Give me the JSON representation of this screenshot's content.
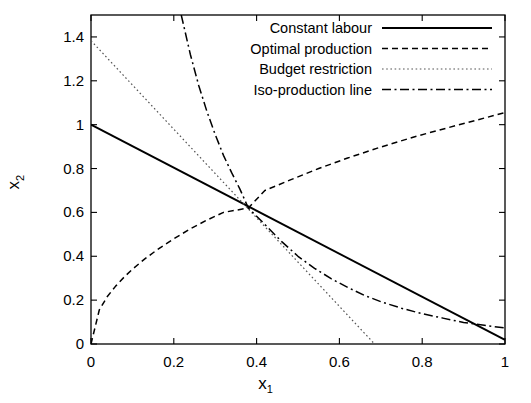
{
  "chart_data": {
    "type": "line",
    "title": "",
    "xlabel": "x_1",
    "ylabel": "x_2",
    "xlabel_base": "x",
    "xlabel_sub": "1",
    "ylabel_base": "x",
    "ylabel_sub": "2",
    "xlim": [
      0,
      1
    ],
    "ylim": [
      0,
      1.5
    ],
    "xticks": [
      "0",
      "0.2",
      "0.4",
      "0.6",
      "0.8",
      "1"
    ],
    "xtick_values": [
      0,
      0.2,
      0.4,
      0.6,
      0.8,
      1
    ],
    "yticks": [
      "0",
      "0.2",
      "0.4",
      "0.6",
      "0.8",
      "1",
      "1.2",
      "1.4"
    ],
    "ytick_values": [
      0,
      0.2,
      0.4,
      0.6,
      0.8,
      1.0,
      1.2,
      1.4
    ],
    "grid": false,
    "legend_position": "top-right",
    "intersection_point": [
      0.38,
      0.62
    ],
    "series": [
      {
        "name": "Constant labour",
        "style": "solid",
        "color": "#000000",
        "width": 1.9,
        "points": [
          [
            0,
            1.0
          ],
          [
            1.0,
            0.019
          ]
        ]
      },
      {
        "name": "Optimal production",
        "style": "dashed",
        "color": "#000000",
        "width": 1.5,
        "points": [
          [
            0,
            0
          ],
          [
            0.02,
            0.155
          ],
          [
            0.04,
            0.218
          ],
          [
            0.06,
            0.265
          ],
          [
            0.08,
            0.305
          ],
          [
            0.1,
            0.341
          ],
          [
            0.13,
            0.388
          ],
          [
            0.16,
            0.43
          ],
          [
            0.2,
            0.48
          ],
          [
            0.24,
            0.525
          ],
          [
            0.28,
            0.565
          ],
          [
            0.32,
            0.6
          ],
          [
            0.38,
            0.62
          ],
          [
            0.42,
            0.7
          ],
          [
            0.48,
            0.747
          ],
          [
            0.55,
            0.8
          ],
          [
            0.62,
            0.848
          ],
          [
            0.7,
            0.898
          ],
          [
            0.78,
            0.944
          ],
          [
            0.86,
            0.985
          ],
          [
            0.93,
            1.02
          ],
          [
            1.0,
            1.055
          ]
        ]
      },
      {
        "name": "Budget restriction",
        "style": "dotted",
        "color": "#555555",
        "width": 1.2,
        "points": [
          [
            0,
            1.383
          ],
          [
            0.685,
            0
          ]
        ]
      },
      {
        "name": "Iso-production line",
        "style": "dashdot",
        "color": "#000000",
        "width": 1.5,
        "points": [
          [
            0.218,
            1.5
          ],
          [
            0.24,
            1.32
          ],
          [
            0.26,
            1.18
          ],
          [
            0.28,
            1.06
          ],
          [
            0.3,
            0.955
          ],
          [
            0.32,
            0.86
          ],
          [
            0.34,
            0.78
          ],
          [
            0.36,
            0.705
          ],
          [
            0.38,
            0.62
          ],
          [
            0.42,
            0.545
          ],
          [
            0.46,
            0.468
          ],
          [
            0.5,
            0.4
          ],
          [
            0.54,
            0.345
          ],
          [
            0.58,
            0.298
          ],
          [
            0.62,
            0.258
          ],
          [
            0.66,
            0.222
          ],
          [
            0.7,
            0.193
          ],
          [
            0.75,
            0.163
          ],
          [
            0.8,
            0.138
          ],
          [
            0.85,
            0.118
          ],
          [
            0.9,
            0.098
          ],
          [
            0.95,
            0.085
          ],
          [
            1.0,
            0.073
          ]
        ]
      }
    ]
  },
  "legend": {
    "entries": [
      {
        "label": "Constant labour",
        "style": "solid"
      },
      {
        "label": "Optimal production",
        "style": "dashed"
      },
      {
        "label": "Budget restriction",
        "style": "dotted"
      },
      {
        "label": "Iso-production line",
        "style": "dashdot"
      }
    ]
  },
  "colors": {
    "axis": "#000000",
    "background": "#ffffff",
    "curve": "#000000",
    "budget": "#555555"
  }
}
